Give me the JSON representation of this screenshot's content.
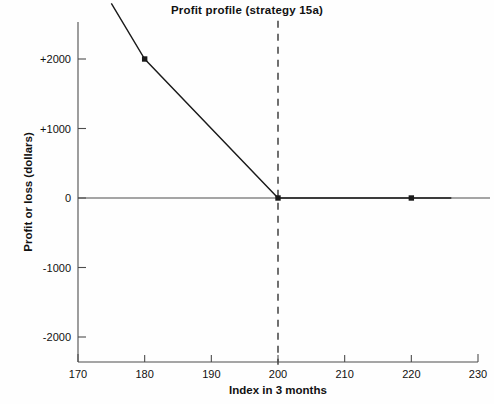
{
  "chart_data": {
    "type": "line",
    "title": "Profit profile (strategy 15a)",
    "xlabel": "Index in 3 months",
    "ylabel": "Profit or loss (dollars)",
    "xlim": [
      170,
      230
    ],
    "ylim": [
      -2400,
      2800
    ],
    "xticks": [
      170,
      180,
      190,
      200,
      210,
      220,
      230
    ],
    "xtick_labels": [
      "170",
      "180",
      "190",
      "200",
      "210",
      "220",
      "230"
    ],
    "yticks": [
      2000,
      1000,
      0,
      -1000,
      -2000
    ],
    "ytick_labels": [
      "+2000",
      "+1000",
      "0",
      "-1000",
      "-2000"
    ],
    "grid": false,
    "legend": null,
    "series": [
      {
        "name": "Profit or loss",
        "x": [
          175,
          180,
          200,
          226
        ],
        "values": [
          2800,
          2000,
          0,
          0
        ],
        "color": "#1a1a1a",
        "marker_points": [
          {
            "x": 180,
            "y": 2000
          },
          {
            "x": 200,
            "y": 0
          },
          {
            "x": 220,
            "y": 0
          }
        ]
      }
    ],
    "annotations": [
      {
        "type": "vertical-dashed-line",
        "x": 200,
        "y_from": 2550,
        "y_to": -2400,
        "color": "#4d4d4d"
      },
      {
        "type": "zero-axis-line",
        "y": 0,
        "color": "#4d4d4d"
      }
    ]
  }
}
